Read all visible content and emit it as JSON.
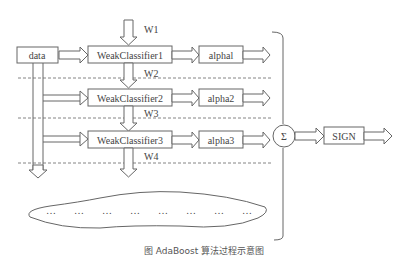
{
  "diagram": {
    "input_label": "data",
    "weights": [
      "W1",
      "W2",
      "W3",
      "W4"
    ],
    "classifiers": [
      "WeakClassifier1",
      "WeakClassifier2",
      "WeakClassifier3"
    ],
    "alphas": [
      "alphal",
      "alpha2",
      "alpha3"
    ],
    "sum_symbol": "Σ",
    "output_label": "SIGN",
    "ellipsis": [
      "…",
      "…",
      "…",
      "…",
      "…",
      "…",
      "…",
      "…"
    ],
    "caption": "图 AdaBoost 算法过程示意图"
  }
}
